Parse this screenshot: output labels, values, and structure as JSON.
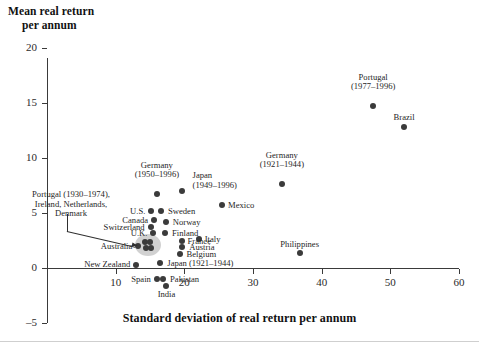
{
  "chart_data": {
    "type": "scatter",
    "title": "",
    "xlabel": "Standard deviation of real return per annum",
    "ylabel": "Mean real return per annum",
    "ylabel_line1": "Mean real return",
    "ylabel_line2": "per annum",
    "xlim": [
      0,
      60
    ],
    "ylim": [
      -5,
      20
    ],
    "xticks": [
      10,
      20,
      30,
      40,
      50,
      60
    ],
    "yticks": [
      -5,
      0,
      5,
      10,
      15,
      20
    ],
    "xtick_labels": [
      "10",
      "20",
      "30",
      "40",
      "50",
      "60"
    ],
    "ytick_labels": [
      "-5",
      "0",
      "5",
      "10",
      "15",
      "20"
    ],
    "grid": false,
    "legend": "none",
    "points": [
      {
        "name": "Portugal (1977-1996)",
        "label": "Portugal\n(1977–1996)",
        "x": 47.5,
        "y": 14.7
      },
      {
        "name": "Brazil",
        "label": "Brazil",
        "x": 52.0,
        "y": 12.8
      },
      {
        "name": "Germany (1921-1944)",
        "label": "Germany\n(1921–1944)",
        "x": 34.2,
        "y": 7.6
      },
      {
        "name": "Germany (1950-1996)",
        "label": "Germany\n(1950–1996)",
        "x": 16.0,
        "y": 6.7
      },
      {
        "name": "Japan (1949-1996)",
        "label": "Japan\n(1949–1996)",
        "x": 19.6,
        "y": 7.0
      },
      {
        "name": "Mexico",
        "label": "Mexico",
        "x": 25.5,
        "y": 5.7
      },
      {
        "name": "U.S.",
        "label": "U.S.",
        "x": 15.2,
        "y": 5.2
      },
      {
        "name": "Sweden",
        "label": "Sweden",
        "x": 16.6,
        "y": 5.2
      },
      {
        "name": "Canada",
        "label": "Canada",
        "x": 15.6,
        "y": 4.4
      },
      {
        "name": "Norway",
        "label": "Norway",
        "x": 17.3,
        "y": 4.2
      },
      {
        "name": "Switzerland",
        "label": "Switzerland",
        "x": 15.1,
        "y": 3.7
      },
      {
        "name": "U.K.",
        "label": "U.K.",
        "x": 15.5,
        "y": 3.2
      },
      {
        "name": "Finland",
        "label": "Finland",
        "x": 17.2,
        "y": 3.2
      },
      {
        "name": "France",
        "label": "France",
        "x": 19.6,
        "y": 2.5
      },
      {
        "name": "Italy",
        "label": "Italy",
        "x": 22.1,
        "y": 2.6
      },
      {
        "name": "Austria",
        "label": "Austria",
        "x": 19.7,
        "y": 1.9
      },
      {
        "name": "Belgium",
        "label": "Belgium",
        "x": 19.3,
        "y": 1.3
      },
      {
        "name": "Australia",
        "label": "Australia",
        "x": 13.3,
        "y": 2.0
      },
      {
        "name": "cluster-point-1",
        "label": "",
        "x": 14.3,
        "y": 2.4
      },
      {
        "name": "cluster-point-2",
        "label": "",
        "x": 15.0,
        "y": 2.4
      },
      {
        "name": "cluster-point-3",
        "label": "",
        "x": 14.4,
        "y": 1.8
      },
      {
        "name": "cluster-point-4",
        "label": "",
        "x": 15.2,
        "y": 1.8
      },
      {
        "name": "New Zealand",
        "label": "New Zealand",
        "x": 13.0,
        "y": 0.3
      },
      {
        "name": "Japan (1921-1944)",
        "label": "Japan (1921–1944)",
        "x": 16.5,
        "y": 0.5
      },
      {
        "name": "Philippines",
        "label": "Philippines",
        "x": 36.8,
        "y": 1.4
      },
      {
        "name": "Spain",
        "label": "Spain",
        "x": 16.0,
        "y": -1.0
      },
      {
        "name": "Pakistan",
        "label": "Pakistan",
        "x": 16.9,
        "y": -1.0
      },
      {
        "name": "India",
        "label": "India",
        "x": 17.4,
        "y": -1.6
      }
    ],
    "cluster_annotation": {
      "label_line1": "Portugal (1930–1974),",
      "label_line2": "Ireland, Netherlands,",
      "label_line3": "Denmark",
      "members": [
        "Portugal (1930-1974)",
        "Ireland",
        "Netherlands",
        "Denmark"
      ],
      "has_leader_line": true,
      "highlight_color": "#c9c9c9"
    },
    "marker_color": "#3b3b3b",
    "axis_color": "#3a3a3a"
  }
}
